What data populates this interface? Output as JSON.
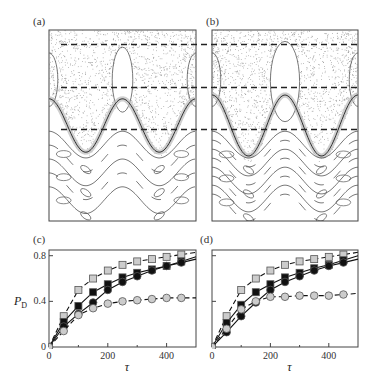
{
  "panels": {
    "a": {
      "label": "(a)"
    },
    "b": {
      "label": "(b)"
    },
    "c": {
      "label": "(c)"
    },
    "d": {
      "label": "(d)"
    }
  },
  "colors": {
    "frame": "#444444",
    "contour": "#555555",
    "chaos_dots": "#777777",
    "dashed": "#222222",
    "light_marker": "#cccccc",
    "dark_marker": "#111111"
  },
  "chart_data": [
    {
      "panel": "a",
      "type": "scatter",
      "title": "",
      "description": "Phase-space portrait: chaotic sea (dots) in upper region with islands, regular wavy invariant curves below; three horizontal dashed lines",
      "dashed_lines_relative_y": [
        0.055,
        0.28,
        0.5
      ]
    },
    {
      "panel": "b",
      "type": "scatter",
      "title": "",
      "description": "Phase-space portrait with larger central island and stronger chaotic layer; regular wavy curves below; three horizontal dashed lines",
      "dashed_lines_relative_y": [
        0.055,
        0.28,
        0.5
      ]
    },
    {
      "panel": "c",
      "type": "line",
      "xlabel": "τ",
      "ylabel": "P_D",
      "ylabel_main": "P",
      "ylabel_sub": "D",
      "xlim": [
        0,
        500
      ],
      "ylim": [
        0,
        0.85
      ],
      "x_ticks": [
        0,
        200,
        400
      ],
      "y_ticks": [
        0,
        0.4,
        0.8
      ],
      "x_tick_labels": [
        "0",
        "200",
        "400"
      ],
      "y_tick_labels": [
        "0",
        "0.4",
        "0.8"
      ],
      "x": [
        0,
        50,
        100,
        150,
        200,
        250,
        300,
        350,
        400,
        450
      ],
      "series": [
        {
          "name": "light squares (dashed)",
          "marker": "square",
          "fill": "light",
          "line": "dashed",
          "values": [
            0,
            0.27,
            0.5,
            0.6,
            0.67,
            0.72,
            0.75,
            0.77,
            0.79,
            0.81
          ]
        },
        {
          "name": "dark squares (solid)",
          "marker": "square",
          "fill": "dark",
          "line": "solid",
          "values": [
            0,
            0.22,
            0.36,
            0.48,
            0.55,
            0.61,
            0.65,
            0.68,
            0.71,
            0.75
          ]
        },
        {
          "name": "dark circles (solid)",
          "marker": "circle",
          "fill": "dark",
          "line": "solid",
          "values": [
            0,
            0.18,
            0.29,
            0.39,
            0.5,
            0.57,
            0.62,
            0.67,
            0.71,
            0.74
          ]
        },
        {
          "name": "light circles (dashed)",
          "marker": "circle",
          "fill": "light",
          "line": "dashed",
          "values": [
            0,
            0.14,
            0.28,
            0.34,
            0.38,
            0.4,
            0.41,
            0.42,
            0.43,
            0.43
          ]
        }
      ]
    },
    {
      "panel": "d",
      "type": "line",
      "xlabel": "τ",
      "ylabel": "",
      "xlim": [
        0,
        500
      ],
      "ylim": [
        0,
        0.85
      ],
      "x_ticks": [
        0,
        200,
        400
      ],
      "x_tick_labels": [
        "0",
        "200",
        "400"
      ],
      "x": [
        0,
        50,
        100,
        150,
        200,
        250,
        300,
        350,
        400,
        450
      ],
      "series": [
        {
          "name": "light squares (dashed)",
          "marker": "square",
          "fill": "light",
          "line": "dashed",
          "values": [
            0,
            0.27,
            0.5,
            0.6,
            0.67,
            0.72,
            0.75,
            0.77,
            0.79,
            0.81
          ]
        },
        {
          "name": "dark squares (solid)",
          "marker": "square",
          "fill": "dark",
          "line": "solid",
          "values": [
            0,
            0.21,
            0.37,
            0.48,
            0.55,
            0.61,
            0.65,
            0.69,
            0.72,
            0.76
          ]
        },
        {
          "name": "dark circles (solid)",
          "marker": "circle",
          "fill": "dark",
          "line": "solid",
          "values": [
            0,
            0.13,
            0.27,
            0.39,
            0.5,
            0.57,
            0.62,
            0.67,
            0.71,
            0.74
          ]
        },
        {
          "name": "light circles (dashed)",
          "marker": "circle",
          "fill": "light",
          "line": "dashed",
          "values": [
            0,
            0.16,
            0.33,
            0.4,
            0.44,
            0.44,
            0.45,
            0.45,
            0.45,
            0.46
          ]
        }
      ]
    }
  ]
}
